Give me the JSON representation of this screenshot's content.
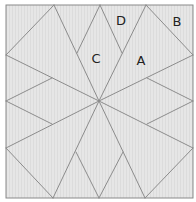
{
  "diagram": {
    "type": "quilt-block",
    "colors": {
      "fill": "#e4e4e4",
      "stripe": "#dadada",
      "line": "#8c8c8c",
      "border": "#8a8a8a",
      "label": "#222222"
    },
    "labels": [
      {
        "id": "A",
        "text": "A",
        "x": 141,
        "y": 65
      },
      {
        "id": "B",
        "text": "B",
        "x": 177,
        "y": 26
      },
      {
        "id": "C",
        "text": "C",
        "x": 96,
        "y": 63
      },
      {
        "id": "D",
        "text": "D",
        "x": 121,
        "y": 25
      }
    ]
  }
}
